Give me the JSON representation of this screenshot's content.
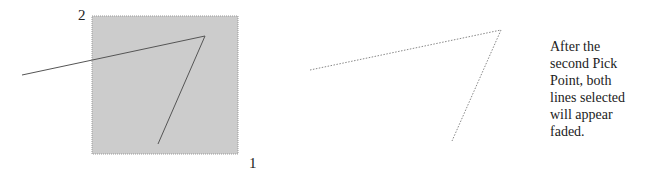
{
  "left_panel": {
    "pick_labels": {
      "first": "1",
      "second": "2"
    },
    "selection_box": {
      "x": 92,
      "y": 16,
      "width": 146,
      "height": 138,
      "fill": "#cccccc",
      "border": "#999999"
    },
    "lines": [
      {
        "x1": 22,
        "y1": 75,
        "x2": 205,
        "y2": 36,
        "color": "#555555"
      },
      {
        "x1": 205,
        "y1": 36,
        "x2": 158,
        "y2": 144,
        "color": "#555555"
      }
    ]
  },
  "right_panel": {
    "faded_lines": [
      {
        "x1": 310,
        "y1": 70,
        "x2": 501,
        "y2": 30,
        "color": "#888888"
      },
      {
        "x1": 501,
        "y1": 30,
        "x2": 452,
        "y2": 141,
        "color": "#888888"
      }
    ]
  },
  "caption": {
    "lines": [
      "After the",
      "second Pick",
      "Point, both",
      "lines selected",
      "will appear",
      "faded."
    ]
  }
}
